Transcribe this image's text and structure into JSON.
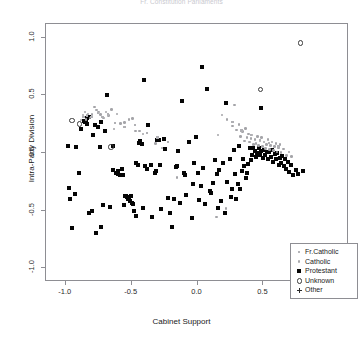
{
  "chart_data": {
    "type": "scatter",
    "title": "Fr. Constitution Parliaments",
    "xlabel": "Cabinet Support",
    "ylabel": "Intra-Party Division",
    "xlim": [
      -1.15,
      1.15
    ],
    "ylim": [
      -1.12,
      1.12
    ],
    "xticks": [
      -1.0,
      -0.5,
      0.0,
      0.5,
      1.0
    ],
    "xtick_labels": [
      "-1.0",
      "-0.5",
      "0.0",
      "0.5",
      "1.0"
    ],
    "yticks": [
      -1.0,
      -0.5,
      0.0,
      0.5,
      1.0
    ],
    "ytick_labels": [
      "-1.0",
      "-0.5",
      "0.0",
      "0.5",
      "1.0"
    ],
    "grid": false,
    "legend_position": "bottom-right",
    "legend": [
      {
        "label": "Fr.Catholic",
        "marker": "small-square",
        "color": "#b4b4b8"
      },
      {
        "label": "Catholic",
        "marker": "dot",
        "color": "#a8a8ac"
      },
      {
        "label": "Protestant",
        "marker": "filled-square",
        "color": "#050505"
      },
      {
        "label": "Unknown",
        "marker": "open-circle",
        "color": "#3a3a3a"
      },
      {
        "label": "Other",
        "marker": "plus",
        "color": "#2a2a2a"
      }
    ],
    "series": [
      {
        "name": "Protestant",
        "marker": "filled-square",
        "color": "#050505",
        "points": [
          [
            -0.985,
            0.06
          ],
          [
            -0.975,
            -0.3
          ],
          [
            -0.965,
            -0.4
          ],
          [
            -0.955,
            -0.655
          ],
          [
            -0.93,
            -0.355
          ],
          [
            -0.92,
            0.055
          ],
          [
            -0.9,
            -0.175
          ],
          [
            -0.885,
            0.205
          ],
          [
            -0.86,
            0.275
          ],
          [
            -0.855,
            0.27
          ],
          [
            -0.845,
            0.265
          ],
          [
            -0.84,
            0.3
          ],
          [
            -0.835,
            0.255
          ],
          [
            -0.825,
            0.315
          ],
          [
            -0.82,
            -0.52
          ],
          [
            -0.8,
            -0.5
          ],
          [
            -0.79,
            0.155
          ],
          [
            -0.78,
            0.245
          ],
          [
            -0.77,
            -0.695
          ],
          [
            -0.755,
            0.225
          ],
          [
            -0.74,
            0.05
          ],
          [
            -0.735,
            -0.645
          ],
          [
            -0.73,
            0.27
          ],
          [
            -0.72,
            -0.455
          ],
          [
            -0.7,
            0.19
          ],
          [
            -0.685,
            0.5
          ],
          [
            -0.665,
            -0.465
          ],
          [
            -0.645,
            0.06
          ],
          [
            -0.64,
            -0.145
          ],
          [
            -0.62,
            -0.175
          ],
          [
            -0.615,
            -0.17
          ],
          [
            -0.605,
            -0.185
          ],
          [
            -0.6,
            -0.155
          ],
          [
            -0.59,
            -0.19
          ],
          [
            -0.575,
            -0.14
          ],
          [
            -0.565,
            -0.195
          ],
          [
            -0.56,
            -0.455
          ],
          [
            -0.55,
            -0.375
          ],
          [
            -0.545,
            -0.37
          ],
          [
            -0.535,
            -0.38
          ],
          [
            -0.53,
            -0.4
          ],
          [
            -0.52,
            -0.385
          ],
          [
            -0.515,
            -0.415
          ],
          [
            -0.505,
            -0.375
          ],
          [
            -0.5,
            -0.43
          ],
          [
            -0.49,
            -0.445
          ],
          [
            -0.485,
            -0.505
          ],
          [
            -0.47,
            -0.09
          ],
          [
            -0.465,
            -0.545
          ],
          [
            -0.455,
            -0.1
          ],
          [
            -0.445,
            0.085
          ],
          [
            -0.435,
            0.1
          ],
          [
            -0.425,
            0.075
          ],
          [
            -0.415,
            -0.48
          ],
          [
            -0.405,
            0.635
          ],
          [
            -0.395,
            -0.115
          ],
          [
            -0.385,
            -0.135
          ],
          [
            -0.375,
            0.24
          ],
          [
            -0.355,
            -0.105
          ],
          [
            -0.345,
            -0.555
          ],
          [
            -0.325,
            -0.175
          ],
          [
            -0.315,
            -0.155
          ],
          [
            -0.305,
            0.11
          ],
          [
            -0.295,
            0.115
          ],
          [
            -0.285,
            -0.1
          ],
          [
            -0.275,
            -0.485
          ],
          [
            -0.255,
            0.125
          ],
          [
            -0.245,
            0.035
          ],
          [
            -0.225,
            -0.395
          ],
          [
            -0.21,
            -0.525
          ],
          [
            -0.195,
            -0.645
          ],
          [
            -0.175,
            -0.4
          ],
          [
            -0.165,
            -0.125
          ],
          [
            -0.155,
            -0.115
          ],
          [
            -0.145,
            0.015
          ],
          [
            -0.135,
            -0.435
          ],
          [
            -0.115,
            0.455
          ],
          [
            -0.105,
            -0.175
          ],
          [
            -0.095,
            -0.19
          ],
          [
            -0.085,
            -0.365
          ],
          [
            -0.065,
            0.095
          ],
          [
            -0.045,
            -0.565
          ],
          [
            -0.035,
            -0.265
          ],
          [
            -0.025,
            -0.09
          ],
          [
            -0.015,
            0.14
          ],
          [
            0.005,
            -0.17
          ],
          [
            0.015,
            -0.41
          ],
          [
            0.025,
            -0.285
          ],
          [
            0.035,
            0.745
          ],
          [
            0.045,
            -0.13
          ],
          [
            0.055,
            -0.44
          ],
          [
            0.075,
            0.555
          ],
          [
            0.095,
            -0.33
          ],
          [
            0.105,
            -0.345
          ],
          [
            0.115,
            -0.26
          ],
          [
            0.135,
            -0.065
          ],
          [
            0.145,
            -0.185
          ],
          [
            0.155,
            -0.475
          ],
          [
            0.165,
            -0.15
          ],
          [
            0.175,
            -0.415
          ],
          [
            0.195,
            -0.09
          ],
          [
            0.205,
            -0.52
          ],
          [
            0.215,
            0.435
          ],
          [
            0.225,
            -0.25
          ],
          [
            0.245,
            -0.055
          ],
          [
            0.255,
            -0.385
          ],
          [
            0.265,
            -0.315
          ],
          [
            0.275,
            0.025
          ],
          [
            0.285,
            -0.185
          ],
          [
            0.295,
            -0.4
          ],
          [
            0.305,
            -0.27
          ],
          [
            0.315,
            0.06
          ],
          [
            0.325,
            -0.315
          ],
          [
            0.335,
            -0.155
          ],
          [
            0.345,
            -0.055
          ],
          [
            0.355,
            -0.115
          ],
          [
            0.365,
            -0.215
          ],
          [
            0.375,
            -0.175
          ],
          [
            0.385,
            -0.095
          ],
          [
            0.395,
            0.04
          ],
          [
            0.405,
            -0.06
          ],
          [
            0.415,
            -0.02
          ],
          [
            0.425,
            0.045
          ],
          [
            0.435,
            0.015
          ],
          [
            0.445,
            -0.035
          ],
          [
            0.455,
            0.0
          ],
          [
            0.465,
            0.045
          ],
          [
            0.475,
            -0.015
          ],
          [
            0.48,
            0.395
          ],
          [
            0.485,
            0.02
          ],
          [
            0.495,
            -0.045
          ],
          [
            0.505,
            0.025
          ],
          [
            0.515,
            -0.02
          ],
          [
            0.525,
            0.01
          ],
          [
            0.535,
            -0.055
          ],
          [
            0.545,
            0.005
          ],
          [
            0.555,
            -0.035
          ],
          [
            0.565,
            0.025
          ],
          [
            0.575,
            -0.075
          ],
          [
            0.585,
            -0.01
          ],
          [
            0.595,
            -0.055
          ],
          [
            0.605,
            0.0
          ],
          [
            0.615,
            -0.1
          ],
          [
            0.625,
            -0.045
          ],
          [
            0.635,
            -0.09
          ],
          [
            0.645,
            -0.025
          ],
          [
            0.655,
            -0.115
          ],
          [
            0.665,
            -0.055
          ],
          [
            0.675,
            -0.135
          ],
          [
            0.685,
            -0.075
          ],
          [
            0.695,
            -0.165
          ],
          [
            0.71,
            -0.105
          ],
          [
            0.725,
            -0.195
          ],
          [
            0.745,
            -0.145
          ],
          [
            0.765,
            -0.185
          ],
          [
            0.8,
            -0.155
          ]
        ]
      },
      {
        "name": "Catholic",
        "marker": "dot",
        "color": "#a4a4a8",
        "points": [
          [
            -0.885,
            0.285
          ],
          [
            -0.87,
            0.33
          ],
          [
            -0.855,
            0.355
          ],
          [
            -0.845,
            0.29
          ],
          [
            -0.83,
            0.34
          ],
          [
            -0.815,
            0.305
          ],
          [
            -0.8,
            0.335
          ],
          [
            -0.78,
            0.4
          ],
          [
            -0.765,
            0.375
          ],
          [
            -0.75,
            0.355
          ],
          [
            -0.735,
            0.335
          ],
          [
            -0.715,
            0.305
          ],
          [
            -0.695,
            0.355
          ],
          [
            -0.675,
            0.325
          ],
          [
            -0.655,
            0.38
          ],
          [
            -0.635,
            0.21
          ],
          [
            -0.61,
            0.34
          ],
          [
            -0.585,
            0.255
          ],
          [
            -0.555,
            0.265
          ],
          [
            -0.52,
            0.29
          ],
          [
            -0.495,
            0.3
          ],
          [
            -0.47,
            0.19
          ],
          [
            -0.44,
            0.19
          ],
          [
            -0.415,
            0.165
          ],
          [
            -0.32,
            0.085
          ],
          [
            -0.27,
            0.045
          ],
          [
            -0.155,
            -0.215
          ],
          [
            0.155,
            0.155
          ],
          [
            0.185,
            0.33
          ],
          [
            0.225,
            0.29
          ],
          [
            0.265,
            0.235
          ],
          [
            0.28,
            0.415
          ],
          [
            0.295,
            0.2
          ],
          [
            0.315,
            0.245
          ],
          [
            0.325,
            0.145
          ],
          [
            0.34,
            0.185
          ],
          [
            0.355,
            0.105
          ],
          [
            0.365,
            0.215
          ],
          [
            0.375,
            0.135
          ],
          [
            0.385,
            0.165
          ],
          [
            0.395,
            0.095
          ],
          [
            0.405,
            0.125
          ],
          [
            0.415,
            0.155
          ],
          [
            0.425,
            0.075
          ],
          [
            0.435,
            0.115
          ],
          [
            0.445,
            0.085
          ],
          [
            0.455,
            0.145
          ],
          [
            0.465,
            0.065
          ],
          [
            0.475,
            0.105
          ],
          [
            0.485,
            0.135
          ],
          [
            0.495,
            0.055
          ],
          [
            0.505,
            0.095
          ],
          [
            0.515,
            0.04
          ],
          [
            0.525,
            0.075
          ],
          [
            0.535,
            0.115
          ],
          [
            0.545,
            0.03
          ],
          [
            0.555,
            0.065
          ],
          [
            0.565,
            0.095
          ],
          [
            0.575,
            0.02
          ],
          [
            0.585,
            0.055
          ],
          [
            0.595,
            0.085
          ],
          [
            0.605,
            0.01
          ],
          [
            0.615,
            0.045
          ],
          [
            0.625,
            0.075
          ],
          [
            0.635,
            0.005
          ],
          [
            0.655,
            0.035
          ],
          [
            0.675,
            -0.02
          ],
          [
            0.695,
            0.01
          ],
          [
            0.715,
            -0.03
          ],
          [
            0.145,
            -0.555
          ],
          [
            0.215,
            -0.48
          ]
        ]
      },
      {
        "name": "Fr.Catholic",
        "marker": "small-square",
        "color": "#b0b0b4",
        "points": [
          [
            -0.865,
            0.315
          ],
          [
            -0.84,
            0.325
          ],
          [
            -0.805,
            0.315
          ],
          [
            -0.755,
            0.345
          ],
          [
            -0.72,
            0.315
          ],
          [
            -0.68,
            0.335
          ],
          [
            -0.625,
            0.26
          ],
          [
            -0.555,
            0.225
          ],
          [
            -0.475,
            0.245
          ],
          [
            -0.385,
            0.175
          ],
          [
            -0.305,
            0.135
          ],
          [
            -0.225,
            0.095
          ],
          [
            0.265,
            0.27
          ],
          [
            0.335,
            0.195
          ],
          [
            0.405,
            0.155
          ],
          [
            0.475,
            0.115
          ],
          [
            0.545,
            0.085
          ],
          [
            0.615,
            0.055
          ]
        ]
      },
      {
        "name": "Unknown",
        "marker": "open-circle",
        "color": "#3a3a3a",
        "points": [
          [
            -0.955,
            0.285
          ],
          [
            -0.9,
            0.255
          ],
          [
            -0.66,
            0.055
          ],
          [
            0.475,
            0.555
          ],
          [
            0.78,
            0.96
          ]
        ]
      },
      {
        "name": "Other",
        "marker": "plus",
        "color": "#2a2a2a",
        "points": []
      }
    ]
  }
}
